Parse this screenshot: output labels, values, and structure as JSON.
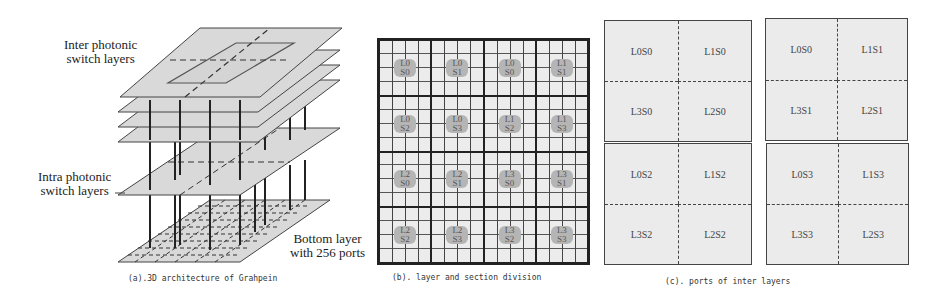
{
  "panel_a": {
    "labels": {
      "inter": [
        "Inter photonic",
        "switch layers"
      ],
      "intra": [
        "Intra photonic",
        "switch layers"
      ],
      "bottom": [
        "Bottom layer",
        "with 256 ports"
      ]
    },
    "caption": "(a).3D architecture of Grahpein"
  },
  "panel_b": {
    "caption": "(b). layer and section division",
    "cells": [
      [
        "L0",
        "S0"
      ],
      [
        "L0",
        "S1"
      ],
      [
        "L0",
        "S0"
      ],
      [
        "L1",
        "S1"
      ],
      [
        "L0",
        "S2"
      ],
      [
        "L0",
        "S3"
      ],
      [
        "L1",
        "S2"
      ],
      [
        "L1",
        "S3"
      ],
      [
        "L2",
        "S0"
      ],
      [
        "L2",
        "S1"
      ],
      [
        "L3",
        "S0"
      ],
      [
        "L3",
        "S1"
      ],
      [
        "L2",
        "S2"
      ],
      [
        "L2",
        "S3"
      ],
      [
        "L3",
        "S2"
      ],
      [
        "L3",
        "S3"
      ]
    ]
  },
  "panel_c": {
    "caption": "(c). ports of inter layers",
    "boxes": [
      [
        "L0S0",
        "L1S0",
        "L3S0",
        "L2S0"
      ],
      [
        "L0S0",
        "L1S1",
        "L3S1",
        "L2S1"
      ],
      [
        "L0S2",
        "L1S2",
        "L3S2",
        "L2S2"
      ],
      [
        "L0S3",
        "L1S3",
        "L3S3",
        "L2S3"
      ]
    ]
  }
}
